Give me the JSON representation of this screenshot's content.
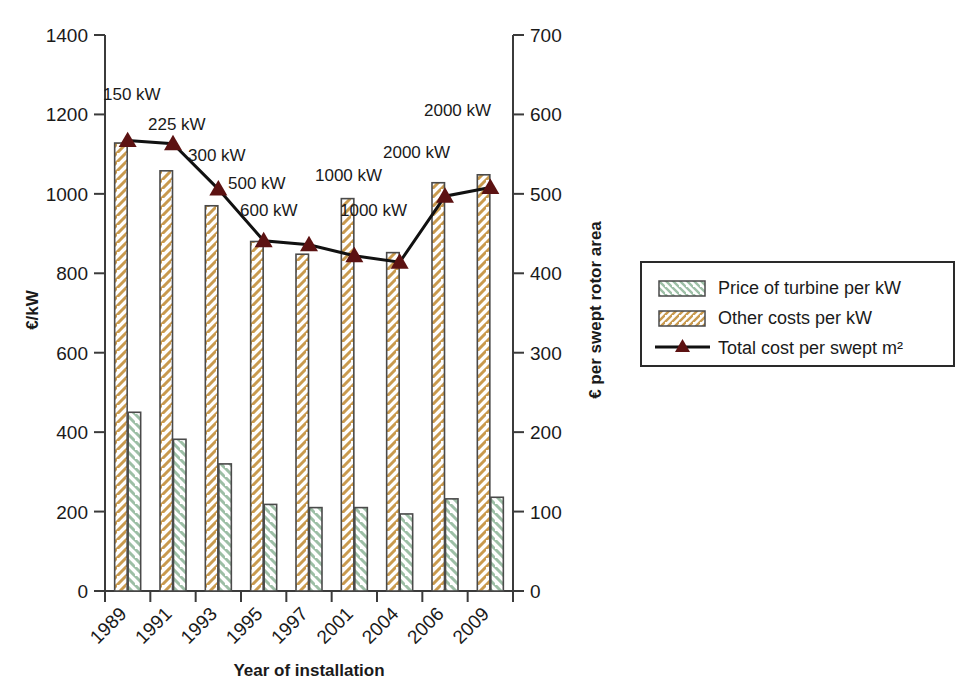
{
  "chart_data": {
    "type": "bar",
    "title": "",
    "xlabel": "Year of installation",
    "ylabel": "€/kW",
    "ylabel_right": "€ per swept rotor area",
    "categories": [
      "1989",
      "1991",
      "1993",
      "1995",
      "1997",
      "2001",
      "2004",
      "2006",
      "2009"
    ],
    "ylim": [
      0,
      1400
    ],
    "yticks": [
      "0",
      "200",
      "400",
      "600",
      "800",
      "1000",
      "1200",
      "1400"
    ],
    "ylim_right": [
      0,
      700
    ],
    "yticks_right": [
      "0",
      "100",
      "200",
      "300",
      "400",
      "500",
      "600",
      "700"
    ],
    "grid": false,
    "legend_position": "right",
    "series": [
      {
        "name": "Other costs per kW",
        "key": "other_costs",
        "type": "bar",
        "axis": "left",
        "color": "#c99a4e",
        "fill": "#ffffff",
        "hatch": "forward-slash",
        "values": [
          1128,
          1058,
          970,
          880,
          848,
          988,
          852,
          1028,
          1048
        ]
      },
      {
        "name": "Price of turbine per kW",
        "key": "turbine_price",
        "type": "bar",
        "axis": "left",
        "color": "#9dbfa6",
        "fill": "#ffffff",
        "hatch": "back-slash",
        "values": [
          450,
          382,
          320,
          218,
          210,
          210,
          194,
          232,
          236
        ]
      },
      {
        "name": "Total cost per swept m²",
        "key": "total_cost_swept",
        "type": "line",
        "axis": "right",
        "color": "#111111",
        "marker": "triangle",
        "marker_color": "#5c1212",
        "values": [
          567,
          563,
          506,
          441,
          436,
          422,
          414,
          497,
          508
        ]
      }
    ],
    "annotations": [
      {
        "text": "150 kW",
        "category": "1989"
      },
      {
        "text": "225 kW",
        "category": "1991"
      },
      {
        "text": "300 kW",
        "category": "1993"
      },
      {
        "text": "500 kW",
        "category": "1995"
      },
      {
        "text": "600 kW",
        "category": "1997"
      },
      {
        "text": "1000 kW",
        "category": "2001"
      },
      {
        "text": "1000 kW",
        "category": "2004"
      },
      {
        "text": "2000 kW",
        "category": "2006"
      },
      {
        "text": "2000 kW",
        "category": "2009"
      }
    ],
    "legend_entries": [
      {
        "label": "Price of turbine per kW",
        "swatch": "hatch-green"
      },
      {
        "label": "Other costs per kW",
        "swatch": "hatch-orange"
      },
      {
        "label": "Total cost per swept m²",
        "swatch": "line-triangle"
      }
    ]
  }
}
